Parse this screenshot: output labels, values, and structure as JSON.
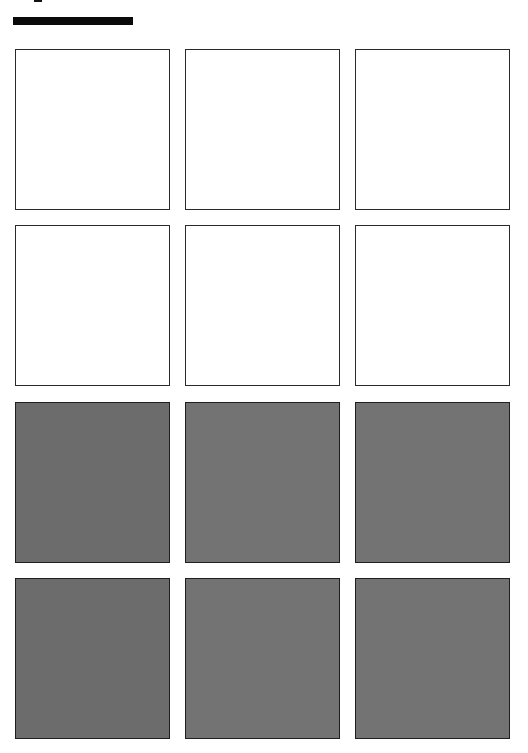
{
  "header": {
    "title_bar_color": "#0a0a0a"
  },
  "grid": {
    "rows": 4,
    "columns": 3,
    "tiles": [
      {
        "row": 1,
        "col": 1,
        "state": "empty",
        "color": "#ffffff"
      },
      {
        "row": 1,
        "col": 2,
        "state": "empty",
        "color": "#ffffff"
      },
      {
        "row": 1,
        "col": 3,
        "state": "empty",
        "color": "#ffffff"
      },
      {
        "row": 2,
        "col": 1,
        "state": "empty",
        "color": "#ffffff"
      },
      {
        "row": 2,
        "col": 2,
        "state": "empty",
        "color": "#ffffff"
      },
      {
        "row": 2,
        "col": 3,
        "state": "empty",
        "color": "#ffffff"
      },
      {
        "row": 3,
        "col": 1,
        "state": "filled",
        "color": "#6c6c6c"
      },
      {
        "row": 3,
        "col": 2,
        "state": "filled",
        "color": "#737373"
      },
      {
        "row": 3,
        "col": 3,
        "state": "filled",
        "color": "#737373"
      },
      {
        "row": 4,
        "col": 1,
        "state": "filled",
        "color": "#6c6c6c"
      },
      {
        "row": 4,
        "col": 2,
        "state": "filled",
        "color": "#737373"
      },
      {
        "row": 4,
        "col": 3,
        "state": "filled",
        "color": "#737373"
      }
    ]
  },
  "colors": {
    "background": "#ffffff",
    "border": "#2a2a2a",
    "filled_tile": "#737373"
  }
}
